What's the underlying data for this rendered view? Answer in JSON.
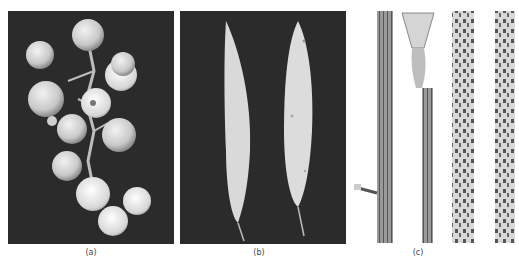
{
  "figure": {
    "panels": [
      {
        "id": "a",
        "caption": "(a)",
        "subject": "grape cluster with diseased berries"
      },
      {
        "id": "b",
        "caption": "(b)",
        "subject": "two pale leaves with spots"
      },
      {
        "id": "c",
        "caption": "(c)",
        "subject": "four plant stems with streaked lesions"
      }
    ]
  },
  "colors": {
    "background": "#ffffff",
    "photo_background": "#2b2b2b"
  }
}
